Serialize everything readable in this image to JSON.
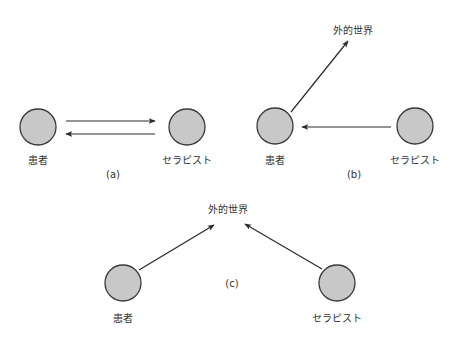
{
  "colors": {
    "node_fill": "#c8c8c8",
    "node_stroke": "#3a3a3a",
    "arrow": "#2a2a2a",
    "text": "#333333"
  },
  "diagrams": [
    {
      "caption": "(a)",
      "nodes": [
        {
          "id": "patient",
          "label": "患者"
        },
        {
          "id": "therapist",
          "label": "セラピスト"
        }
      ],
      "edges": [
        {
          "from": "patient",
          "to": "therapist"
        },
        {
          "from": "therapist",
          "to": "patient"
        }
      ]
    },
    {
      "caption": "(b)",
      "outside_label": "外的世界",
      "nodes": [
        {
          "id": "patient",
          "label": "患者"
        },
        {
          "id": "therapist",
          "label": "セラピスト"
        }
      ],
      "edges": [
        {
          "from": "patient",
          "to": "outside_world"
        },
        {
          "from": "therapist",
          "to": "patient"
        }
      ]
    },
    {
      "caption": "(c)",
      "outside_label": "外的世界",
      "nodes": [
        {
          "id": "patient",
          "label": "患者"
        },
        {
          "id": "therapist",
          "label": "セラピスト"
        }
      ],
      "edges": [
        {
          "from": "patient",
          "to": "outside_world"
        },
        {
          "from": "therapist",
          "to": "outside_world"
        }
      ]
    }
  ]
}
